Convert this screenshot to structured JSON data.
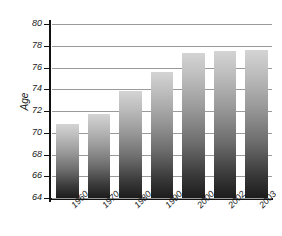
{
  "chart_data": {
    "type": "bar",
    "title": "",
    "subtitle": "",
    "xlabel": "",
    "ylabel": "Age",
    "categories": [
      "1960",
      "1970",
      "1980",
      "1990",
      "2000",
      "2002",
      "2003"
    ],
    "values": [
      70.8,
      71.7,
      73.8,
      75.6,
      77.3,
      77.5,
      77.6
    ],
    "ylim": [
      64,
      80
    ],
    "yticks": [
      64,
      66,
      68,
      70,
      72,
      74,
      76,
      78,
      80
    ],
    "ytick_labels": [
      "64",
      "66",
      "68",
      "70",
      "72",
      "74",
      "76",
      "78",
      "80"
    ],
    "grid": true,
    "grid_axis": "y",
    "legend": false,
    "legend_position": "none",
    "bar_fill": "vertical-gradient-light-to-dark",
    "bar_color_top": "#d4d4d4",
    "bar_color_bottom": "#1c1c1c",
    "grid_color": "#9a9a9a",
    "axis_color": "#111111",
    "background_color": "#ffffff",
    "text_color": "#1a1a1a"
  },
  "axes": {
    "y_title": "Age"
  }
}
